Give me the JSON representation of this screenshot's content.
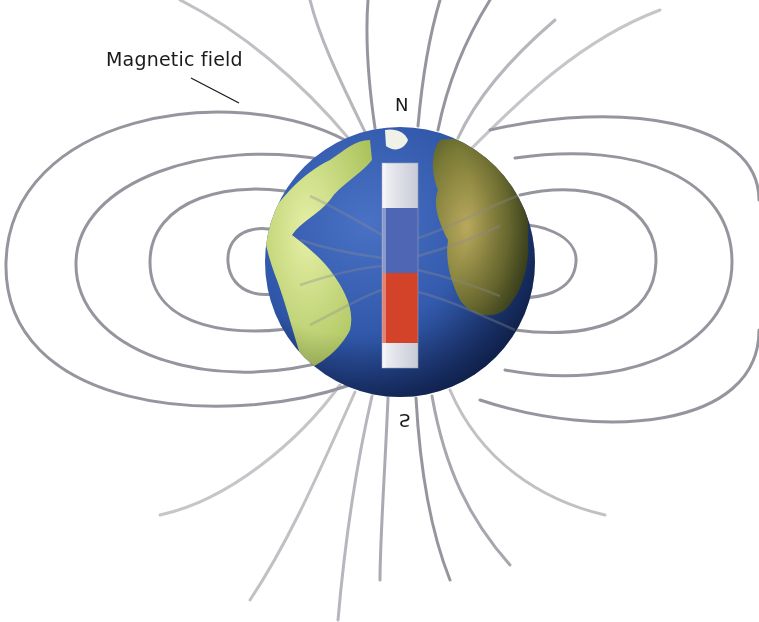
{
  "diagram": {
    "labels": {
      "field": "Magnetic field",
      "north": "N",
      "south": "S"
    },
    "colors": {
      "background": "#ffffff",
      "field_line": "#8a8a94",
      "ocean": "#2f56a8",
      "ocean_dark": "#132a68",
      "land_light": "#d8e89a",
      "land_dark": "#5e6e2a",
      "magnet_north": "#4e66b3",
      "magnet_south": "#d2432a",
      "magnet_cap": "#dcdde6",
      "leader_line": "#1a1a1a"
    },
    "globe": {
      "cx": 400,
      "cy": 262,
      "r": 135
    },
    "magnet": {
      "x": 382,
      "y": 163,
      "width": 36,
      "height": 205,
      "segments": [
        {
          "name": "top-cap",
          "color": "#dcdde6",
          "height": 45
        },
        {
          "name": "north-pole-blue",
          "color": "#4e66b3",
          "height": 65
        },
        {
          "name": "south-pole-red",
          "color": "#d2432a",
          "height": 70
        },
        {
          "name": "bottom-cap",
          "color": "#dcdde6",
          "height": 25
        }
      ]
    },
    "closed_loops": {
      "left": [
        {
          "rx": 40,
          "ry": 34
        },
        {
          "rx": 115,
          "ry": 70
        },
        {
          "rx": 185,
          "ry": 110
        },
        {
          "rx": 260,
          "ry": 155
        }
      ],
      "right": [
        {
          "rx": 40,
          "ry": 34
        },
        {
          "rx": 115,
          "ry": 70
        },
        {
          "rx": 185,
          "ry": 110
        },
        {
          "rx": 260,
          "ry": 155
        }
      ]
    },
    "open_lines_count": {
      "top": 8,
      "bottom": 8
    }
  }
}
